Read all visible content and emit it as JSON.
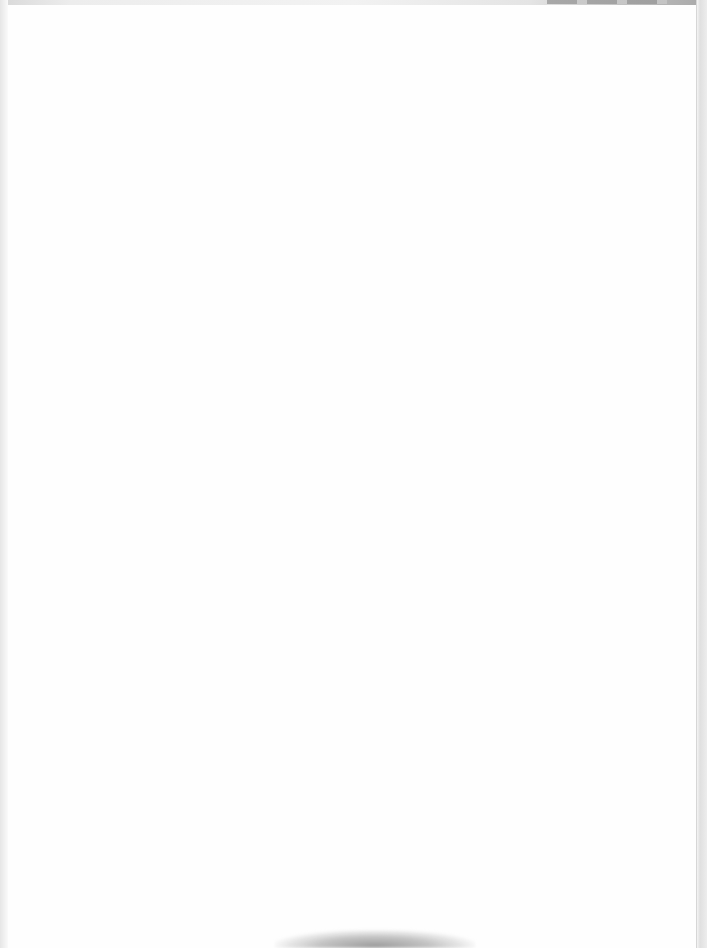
{
  "document": {
    "type": "scanned-page",
    "content": "",
    "is_blank": true
  },
  "colors": {
    "paper": "#fefefe",
    "edge_shadow": "#a8a8a8",
    "smudge": "#9c9c9c"
  }
}
